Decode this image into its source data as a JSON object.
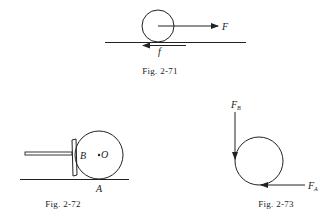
{
  "figures": [
    {
      "caption": "Fig. 2-71",
      "labels": {
        "force": "F",
        "friction": "f"
      },
      "description": "Wheel on horizontal surface pulled by force F at center, friction f at contact point"
    },
    {
      "caption": "Fig. 2-72",
      "labels": {
        "contact_plate": "B",
        "center": "O",
        "ground_contact": "A"
      },
      "description": "Wheel pushed by rod with plate contacting at B, resting on ground at A"
    },
    {
      "caption": "Fig. 2-73",
      "labels": {
        "force_b": "F",
        "force_b_sub": "B",
        "force_a": "F",
        "force_a_sub": "A"
      },
      "description": "Free-body circle with vertical force F_B at left and horizontal force F_A at bottom"
    }
  ],
  "colors": {
    "ink": "#222222",
    "background": "#ffffff"
  }
}
